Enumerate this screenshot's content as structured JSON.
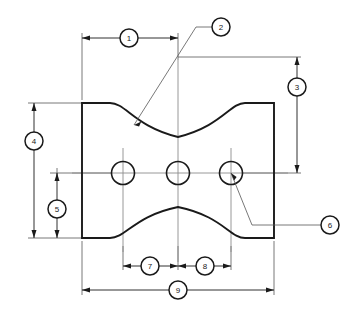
{
  "drawing": {
    "title": "Mechanical Part Dimensioned Drawing",
    "background_color": "#ffffff",
    "line_color": "#1a1a1a",
    "thin_line_color": "#555555",
    "centerline_color": "#8c8c8c",
    "width": 361,
    "height": 309
  },
  "balloons": [
    {
      "id": "1",
      "label": "1",
      "cx": 129,
      "cy": 38,
      "r": 9,
      "kind": "dimension",
      "description": "overall width from left edge to center"
    },
    {
      "id": "2",
      "label": "2",
      "cx": 221,
      "cy": 27,
      "r": 9,
      "kind": "leader",
      "description": "top concave radius callout"
    },
    {
      "id": "3",
      "label": "3",
      "cx": 297,
      "cy": 87,
      "r": 9,
      "kind": "dimension",
      "description": "vertical distance from top datum to hole centerline"
    },
    {
      "id": "4",
      "label": "4",
      "cx": 34,
      "cy": 141,
      "r": 9,
      "kind": "dimension",
      "description": "overall height of part"
    },
    {
      "id": "5",
      "label": "5",
      "cx": 57,
      "cy": 209,
      "r": 9,
      "kind": "dimension",
      "description": "distance from hole centerline to bottom edge"
    },
    {
      "id": "6",
      "label": "6",
      "cx": 330,
      "cy": 225,
      "r": 9,
      "kind": "leader",
      "description": "hole diameter callout"
    },
    {
      "id": "7",
      "label": "7",
      "cx": 150,
      "cy": 266,
      "r": 9,
      "kind": "dimension",
      "description": "spacing between left hole and center hole"
    },
    {
      "id": "8",
      "label": "8",
      "cx": 205,
      "cy": 266,
      "r": 9,
      "kind": "dimension",
      "description": "spacing between center hole and right hole"
    },
    {
      "id": "9",
      "label": "9",
      "cx": 178,
      "cy": 290,
      "r": 9,
      "kind": "dimension",
      "description": "overall length of part"
    }
  ],
  "part": {
    "left_edge_x": 82,
    "right_edge_x": 274,
    "top_edge_y": 103,
    "bottom_edge_y": 238,
    "top_flat_left_end_x": 110,
    "top_flat_right_start_x": 245,
    "top_arc_bottom_y": 137,
    "bottom_arc_top_y": 207,
    "outline_path": "M 82 103 L 110 103 C 126 103 134 126 178 137 C 222 126 230 103 245 103 L 274 103 L 274 238 L 245 238 C 230 238 222 216 178 207 C 134 216 126 238 110 238 L 82 238 Z"
  },
  "holes": [
    {
      "name": "hole-left",
      "cx": 123,
      "cy": 173,
      "r": 11.5
    },
    {
      "name": "hole-center",
      "cx": 178,
      "cy": 173,
      "r": 11.5
    },
    {
      "name": "hole-right",
      "cx": 231,
      "cy": 173,
      "r": 11.5
    }
  ],
  "dimension_lines": [
    {
      "name": "dim-1",
      "orientation": "horizontal",
      "x1": 82,
      "x2": 178,
      "y": 38
    },
    {
      "name": "dim-3",
      "orientation": "vertical",
      "x": 297,
      "y1": 57,
      "y2": 173
    },
    {
      "name": "dim-4",
      "orientation": "vertical",
      "x": 34,
      "y1": 103,
      "y2": 238
    },
    {
      "name": "dim-5",
      "orientation": "vertical",
      "x": 57,
      "y1": 173,
      "y2": 238
    },
    {
      "name": "dim-7",
      "orientation": "horizontal",
      "x1": 123,
      "x2": 178,
      "y": 266
    },
    {
      "name": "dim-8",
      "orientation": "horizontal",
      "x1": 178,
      "x2": 231,
      "y": 266
    },
    {
      "name": "dim-9",
      "orientation": "horizontal",
      "x1": 82,
      "x2": 274,
      "y": 290
    }
  ],
  "leaders": [
    {
      "name": "leader-2",
      "points": "212,27 196,27 134,125",
      "arrow_at": "134,125",
      "arrow_angle": 122
    },
    {
      "name": "leader-6",
      "points": "321,225 252,225 231,173",
      "arrow_at": "231,173",
      "arrow_angle": 248
    }
  ]
}
